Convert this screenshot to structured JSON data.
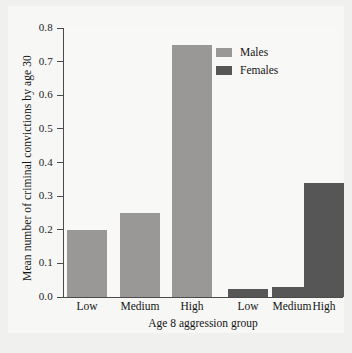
{
  "chart_data": {
    "type": "bar",
    "title": "",
    "xlabel": "Age 8 aggression group",
    "ylabel": "Mean number of criminal convictions by age 30",
    "ylim": [
      0.0,
      0.8
    ],
    "ytick_labels": [
      "0.0",
      "0.1",
      "0.2",
      "0.3",
      "0.4",
      "0.5",
      "0.6",
      "0.7",
      "0.8"
    ],
    "ytick_values": [
      0.0,
      0.1,
      0.2,
      0.3,
      0.4,
      0.5,
      0.6,
      0.7,
      0.8
    ],
    "grid": false,
    "legend_position": "top-right",
    "categories": [
      "Low",
      "Medium",
      "High"
    ],
    "series": [
      {
        "name": "Males",
        "color": "#999897",
        "values": [
          0.2,
          0.25,
          0.75
        ]
      },
      {
        "name": "Females",
        "color": "#565656",
        "values": [
          0.025,
          0.03,
          0.34
        ]
      }
    ],
    "bars": [
      {
        "group": "Males",
        "category": "Low",
        "value": 0.2,
        "label": "Low"
      },
      {
        "group": "Males",
        "category": "Medium",
        "value": 0.25,
        "label": "Medium"
      },
      {
        "group": "Males",
        "category": "High",
        "value": 0.75,
        "label": "High"
      },
      {
        "group": "Females",
        "category": "Low",
        "value": 0.025,
        "label": "Low"
      },
      {
        "group": "Females",
        "category": "Medium",
        "value": 0.03,
        "label": "Medium"
      },
      {
        "group": "Females",
        "category": "High",
        "value": 0.34,
        "label": "High"
      }
    ],
    "x_tick_labels": [
      "Low",
      "Medium",
      "High",
      "Low",
      "Medium",
      "High"
    ]
  },
  "legend": {
    "items": [
      {
        "label": "Males",
        "color": "#999897"
      },
      {
        "label": "Females",
        "color": "#565656"
      }
    ]
  },
  "colors": {
    "males": "#999897",
    "females": "#565656",
    "axis": "#4a4a4a",
    "text": "#141414",
    "figure_background": "#f0f0ef",
    "plot_background": "#f8f8f7"
  }
}
